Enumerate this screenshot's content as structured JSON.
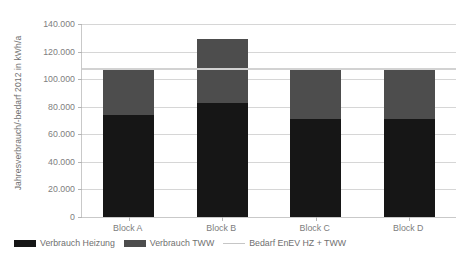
{
  "chart_data": {
    "type": "bar",
    "title": "",
    "subtitle": "",
    "xlabel": "",
    "ylabel": "Jahresverbrauch/-bedarf 2012 in kWh/a",
    "categories": [
      "Block A",
      "Block B",
      "Block C",
      "Block D"
    ],
    "series": [
      {
        "name": "Verbrauch Heizung",
        "type": "bar-stacked",
        "color": "#161616",
        "values": [
          74000,
          83000,
          71000,
          71000
        ]
      },
      {
        "name": "Verbrauch TWW",
        "type": "bar-stacked",
        "color": "#4d4d4d",
        "values": [
          33000,
          46000,
          36000,
          36000
        ]
      },
      {
        "name": "Bedarf EnEV HZ + TWW",
        "type": "line",
        "color": "#d2d2d2",
        "values": [
          107000,
          107000,
          107000,
          107000
        ]
      }
    ],
    "totals": [
      107000,
      129000,
      107000,
      107000
    ],
    "ylim": [
      0,
      140000
    ],
    "ytick_step": 20000,
    "ytick_labels": [
      "140.000",
      "120.000",
      "100.000",
      "80.000",
      "60.000",
      "40.000",
      "20.000",
      "0"
    ],
    "ytick_values": [
      140000,
      120000,
      100000,
      80000,
      60000,
      40000,
      20000,
      0
    ],
    "grid": true,
    "legend_position": "bottom-left",
    "stacked": true
  },
  "axis": {
    "y_title": "Jahresverbrauch/-bedarf 2012 in kWh/a"
  },
  "legend": {
    "items": [
      {
        "label": "Verbrauch Heizung",
        "marker": "box",
        "color": "#161616"
      },
      {
        "label": "Verbrauch TWW",
        "marker": "box",
        "color": "#4d4d4d"
      },
      {
        "label": "Bedarf EnEV HZ + TWW",
        "marker": "line",
        "color": "#d2d2d2"
      }
    ]
  }
}
